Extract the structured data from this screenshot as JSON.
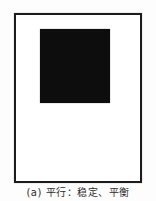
{
  "figure": {
    "caption_label": "(a) 平行：稳定、平衡",
    "label_letter": "a",
    "colors": {
      "background": "#fdfdfd",
      "frame_border": "#1c1c1c",
      "square_fill": "#0d0d0d",
      "caption_text": "#2e2b28"
    }
  }
}
